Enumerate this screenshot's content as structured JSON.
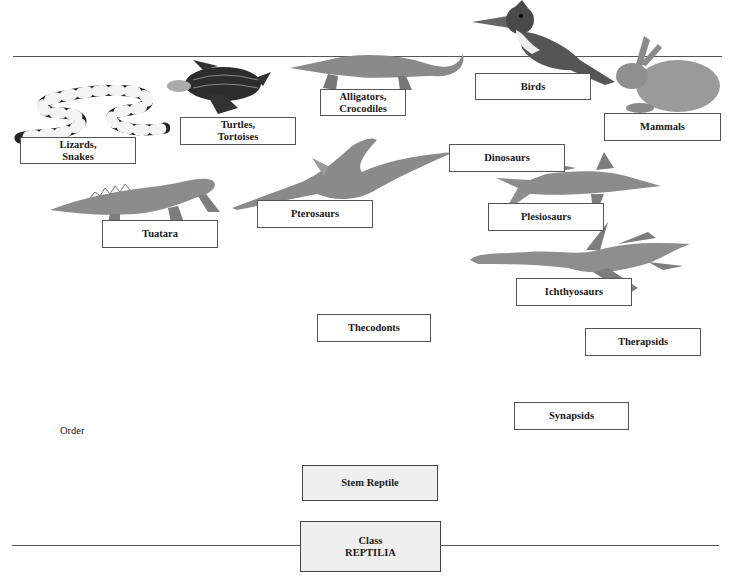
{
  "diagram": {
    "axis_label": "Order",
    "root": {
      "line1": "Class",
      "line2": "REPTILIA"
    },
    "stem": "Stem Reptile",
    "nodes": {
      "lizards": "Lizards,\nSnakes",
      "turtles": "Turtles,\nTortoises",
      "alligators": "Alligators,\nCrocodiles",
      "birds": "Birds",
      "mammals": "Mammals",
      "dinosaurs": "Dinosaurs",
      "tuatara": "Tuatara",
      "pterosaurs": "Pterosaurs",
      "plesiosaurs": "Plesiosaurs",
      "ichthyosaurs": "Ichthyosaurs",
      "thecodonts": "Thecodonts",
      "therapsids": "Therapsids",
      "synapsids": "Synapsids"
    },
    "illustrations": [
      "banded snake",
      "leatherback turtle",
      "alligator",
      "kingfisher bird",
      "rabbit",
      "tuatara lizard",
      "pterosaur",
      "ichthyosaur",
      "plesiosaur"
    ],
    "colors": {
      "line": "#555555",
      "shaded_box": "#efefef",
      "box_border": "#555555"
    }
  }
}
